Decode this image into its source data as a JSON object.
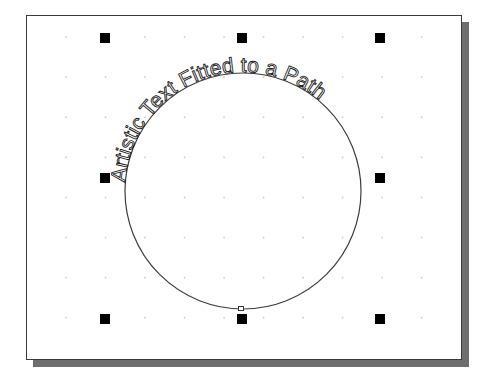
{
  "canvas": {
    "artistic_text": "Artistic Text Fitted to a Path",
    "path_shape": "circle",
    "colors": {
      "page_background": "#ffffff",
      "page_border": "#3a3a3a",
      "page_shadow": "#6e6e6e",
      "grid_dot": "#c8c8c8",
      "handle": "#000000",
      "path_stroke": "#3c3c3c",
      "text_outline": "#1a1a1a"
    },
    "selection_handles": [
      {
        "position": "top-left",
        "icon": "square-handle"
      },
      {
        "position": "top-middle",
        "icon": "square-handle"
      },
      {
        "position": "top-right",
        "icon": "square-handle"
      },
      {
        "position": "middle-left",
        "icon": "square-handle"
      },
      {
        "position": "middle-right",
        "icon": "square-handle"
      },
      {
        "position": "bottom-left",
        "icon": "square-handle"
      },
      {
        "position": "bottom-middle",
        "icon": "square-handle"
      },
      {
        "position": "bottom-right",
        "icon": "square-handle"
      }
    ]
  }
}
